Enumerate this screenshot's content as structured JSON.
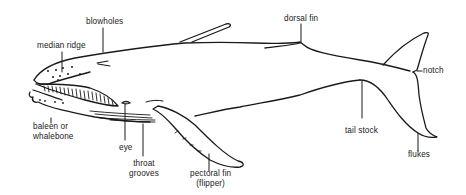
{
  "diagram": {
    "colors": {
      "line": "#1a1a1a",
      "text": "#222222",
      "background": "#ffffff"
    },
    "labels": {
      "blowholes": "blowholes",
      "median_ridge": "median ridge",
      "dorsal_fin": "dorsal fin",
      "notch": "notch",
      "baleen_line1": "baleen or",
      "baleen_line2": "whalebone",
      "eye": "eye",
      "throat_line1": "throat",
      "throat_line2": "grooves",
      "pectoral_line1": "pectoral fin",
      "pectoral_line2": "(flipper)",
      "tail_stock": "tail stock",
      "flukes": "flukes"
    }
  }
}
